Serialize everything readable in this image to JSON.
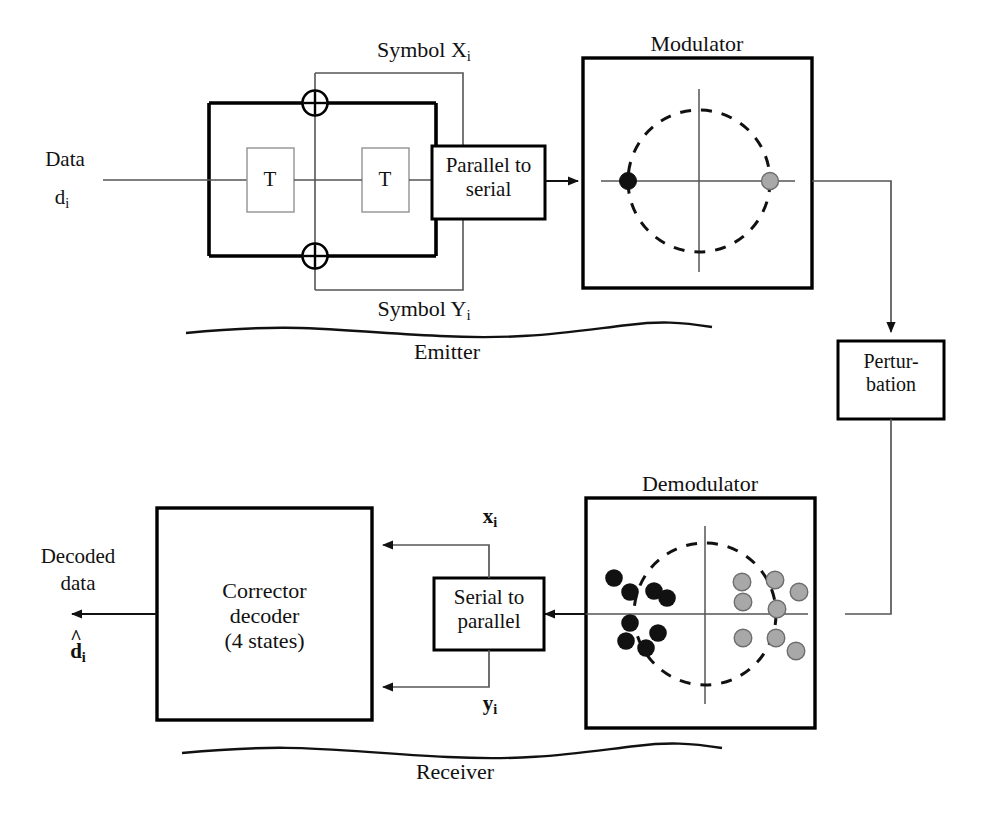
{
  "diagram": {
    "colors": {
      "line": "#111111",
      "bold_line": "#000000",
      "thin_line": "#555555",
      "point_black": "#111111",
      "point_gray": "#a8a8a8",
      "point_gray_edge": "#6d6d6d",
      "background": "#ffffff"
    },
    "emitter": {
      "brace_label": "Emitter",
      "input_label_top": "Data",
      "input_label_bottom": "d",
      "input_label_bottom_sub": "i",
      "delay_1": "T",
      "delay_2": "T",
      "xor_glyph": "⊕",
      "output_top_label": "Symbol  X",
      "output_top_sub": "i",
      "output_bottom_label": "Symbol  Y",
      "output_bottom_sub": "i",
      "parallel_to_serial": "Parallel to\nserial",
      "parallel_to_serial_line1": "Parallel to",
      "parallel_to_serial_line2": "serial"
    },
    "modulator": {
      "title": "Modulator",
      "constellation": {
        "type": "scatter",
        "circle_dashed": true,
        "axes": [
          "horizontal",
          "vertical"
        ],
        "points": [
          {
            "x": -1.0,
            "y": 0.0,
            "color": "black",
            "label": "symbol 0"
          },
          {
            "x": 1.0,
            "y": 0.0,
            "color": "gray",
            "label": "symbol 1"
          }
        ]
      }
    },
    "channel": {
      "box_line1": "Pertur-",
      "box_line2": "bation"
    },
    "demodulator": {
      "title": "Demodulator",
      "constellation": {
        "type": "scatter",
        "circle_dashed": true,
        "axes": [
          "horizontal",
          "vertical"
        ],
        "points": [
          {
            "x": -1.28,
            "y": 0.52,
            "color": "black"
          },
          {
            "x": -1.06,
            "y": 0.33,
            "color": "black"
          },
          {
            "x": -0.72,
            "y": 0.34,
            "color": "black"
          },
          {
            "x": -0.54,
            "y": 0.24,
            "color": "black"
          },
          {
            "x": -1.06,
            "y": -0.12,
            "color": "black"
          },
          {
            "x": -0.66,
            "y": -0.27,
            "color": "black"
          },
          {
            "x": -1.12,
            "y": -0.38,
            "color": "black"
          },
          {
            "x": -0.84,
            "y": -0.47,
            "color": "black"
          },
          {
            "x": 0.52,
            "y": 0.45,
            "color": "gray"
          },
          {
            "x": 0.98,
            "y": 0.48,
            "color": "gray"
          },
          {
            "x": 1.32,
            "y": 0.31,
            "color": "gray"
          },
          {
            "x": 0.54,
            "y": 0.17,
            "color": "gray"
          },
          {
            "x": 1.01,
            "y": 0.07,
            "color": "gray"
          },
          {
            "x": 0.54,
            "y": -0.34,
            "color": "gray"
          },
          {
            "x": 0.98,
            "y": -0.34,
            "color": "gray"
          },
          {
            "x": 1.26,
            "y": -0.52,
            "color": "gray"
          }
        ]
      }
    },
    "receiver": {
      "brace_label": "Receiver",
      "serial_to_parallel_line1": "Serial to",
      "serial_to_parallel_line2": "parallel",
      "soft_output_top": "x",
      "soft_output_top_sub": "i",
      "soft_output_bottom": "y",
      "soft_output_bottom_sub": "i",
      "decoder_line1": "Corrector",
      "decoder_line2": "decoder",
      "decoder_line3": "(4 states)",
      "output_label_line1": "Decoded",
      "output_label_line2": "data",
      "output_symbol": "d",
      "output_symbol_sub": "i"
    }
  }
}
